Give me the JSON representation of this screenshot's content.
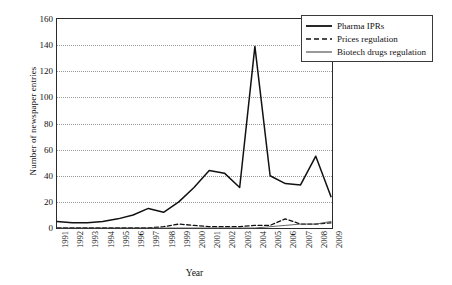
{
  "chart_data": {
    "type": "line",
    "title": "",
    "xlabel": "Year",
    "ylabel": "Number of newspaper entries",
    "x": [
      "1991",
      "1992",
      "1993",
      "1994",
      "1995",
      "1996",
      "1997",
      "1998",
      "1999",
      "2000",
      "2001",
      "2002",
      "2003",
      "2004",
      "2005",
      "2006",
      "2007",
      "2008",
      "2009"
    ],
    "categories": [
      "1991",
      "1992",
      "1993",
      "1994",
      "1995",
      "1996",
      "1997",
      "1998",
      "1999",
      "2000",
      "2001",
      "2002",
      "2003",
      "2004",
      "2005",
      "2006",
      "2007",
      "2008",
      "2009"
    ],
    "ylim": [
      0,
      160
    ],
    "yticks": [
      0,
      20,
      40,
      60,
      80,
      100,
      120,
      140,
      160
    ],
    "grid": true,
    "legend_position": "top-right",
    "series": [
      {
        "name": "Pharma IPRs",
        "style": "solid-thick",
        "values": [
          5,
          4,
          4,
          5,
          7,
          10,
          15,
          12,
          20,
          31,
          44,
          42,
          31,
          139,
          40,
          34,
          33,
          55,
          24
        ]
      },
      {
        "name": "Prices regulation",
        "style": "dashed",
        "values": [
          0,
          0,
          0,
          0,
          0,
          0,
          0,
          1,
          3,
          2,
          1,
          1,
          1,
          2,
          2,
          7,
          3,
          3,
          4
        ]
      },
      {
        "name": "Biotech drugs regulation",
        "style": "solid-thin",
        "values": [
          0,
          0,
          0,
          0,
          0,
          0,
          0,
          0,
          0,
          0,
          0,
          0,
          0,
          0,
          1,
          2,
          3,
          3,
          5
        ]
      }
    ]
  },
  "legend": {
    "items": [
      {
        "label": "Pharma IPRs",
        "style": "solid-thick"
      },
      {
        "label": "Prices regulation",
        "style": "dashed"
      },
      {
        "label": "Biotech drugs regulation",
        "style": "solid-thin"
      }
    ]
  },
  "colors": {
    "series_pharma": "#111111",
    "series_prices": "#111111",
    "series_biotech": "#555555",
    "axis": "#2b2b2b",
    "grid": "#9a9a9a",
    "background": "#ffffff"
  }
}
